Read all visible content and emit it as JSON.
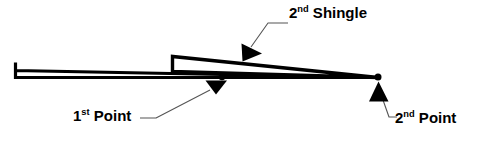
{
  "diagram": {
    "background_color": "#FFFFFF",
    "stroke_color": "#000000",
    "labels": {
      "second_shingle": {
        "ordinal": "2",
        "suffix": "nd",
        "text": " Shingle",
        "full": "2nd Shingle"
      },
      "first_point": {
        "ordinal": "1",
        "suffix": "st",
        "text": " Point",
        "full": "1st Point"
      },
      "second_point": {
        "ordinal": "2",
        "suffix": "nd",
        "text": " Point",
        "full": "2nd Point"
      }
    },
    "markers": {
      "first_point_dot": {
        "x": 222,
        "y": 77,
        "r": 3.2
      },
      "second_point_dot": {
        "x": 378,
        "y": 77,
        "r": 3.4
      }
    },
    "shapes": {
      "first_shingle": "tapered wedge, left butt edge vertical, tip at right convergence point",
      "second_shingle": "tapered wedge overlapping first, left butt edge vertical at mid-span"
    }
  }
}
